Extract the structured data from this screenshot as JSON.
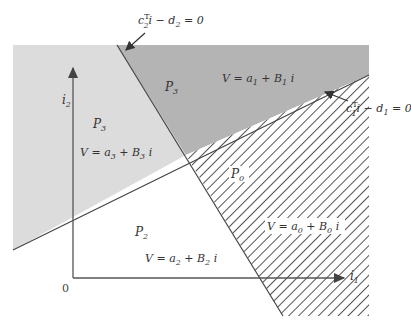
{
  "diagram": {
    "type": "piecewise-affine partition",
    "axes": {
      "x_label": "i",
      "x_label_sub": "1",
      "y_label": "i",
      "y_label_sub": "2",
      "origin_label": "0"
    },
    "boundaries": [
      {
        "id": "line2",
        "eq_c": "c",
        "eq_c_sub": "2",
        "eq_sup": "T",
        "eq_rest": "i − d",
        "eq_d_sub": "2",
        "eq_end": " = 0"
      },
      {
        "id": "line1",
        "eq_c": "c",
        "eq_c_sub": "1",
        "eq_sup": "T",
        "eq_rest": "i − d",
        "eq_d_sub": "1",
        "eq_end": " = 0"
      }
    ],
    "regions": [
      {
        "id": "left",
        "name": "P",
        "name_sub": "3",
        "v_lhs": "V = a",
        "a_sub": "3",
        "v_mid": " + B",
        "b_sub": "3",
        "v_end": " i",
        "fill": "#dcdcdc"
      },
      {
        "id": "top",
        "name": "P",
        "name_sub": "3",
        "v_lhs": "V = a",
        "a_sub": "1",
        "v_mid": " + B",
        "b_sub": "1",
        "v_end": " i",
        "fill": "#b4b4b4"
      },
      {
        "id": "hatched",
        "name": "P",
        "name_sub": "0",
        "v_lhs": "V = a",
        "a_sub": "0",
        "v_mid": " + B",
        "b_sub": "0",
        "v_end": " i",
        "fill": "hatch"
      },
      {
        "id": "bottom",
        "name": "P",
        "name_sub": "2",
        "v_lhs": "V = a",
        "a_sub": "2",
        "v_mid": " + B",
        "b_sub": "2",
        "v_end": " i",
        "fill": "#ffffff"
      }
    ]
  }
}
